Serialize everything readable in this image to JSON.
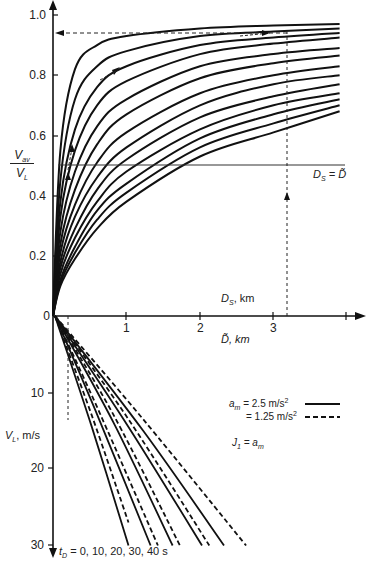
{
  "chart_data": [
    {
      "type": "line",
      "panel": "upper",
      "title": "",
      "ylabel": "V_av / V_L",
      "xlabel_top": "D_S, km",
      "xlabel_bottom": "D~, km",
      "ylim": [
        0,
        1.0
      ],
      "xlim": [
        0,
        4.0
      ],
      "y_ticks": [
        "0",
        "0.2",
        "0.4",
        "0.6",
        "0.8",
        "1.0"
      ],
      "x_ticks": [
        "1",
        "2",
        "3"
      ],
      "annotations": [
        "D_S = D~"
      ],
      "reference_lines": {
        "horizontal_y": 0.5,
        "dashed_vertical_x": [
          0.2,
          3.2
        ],
        "dashed_horizontal_y": 0.94
      },
      "grid": false,
      "series_description": "Family of 13 saturating curves of V_av/V_L vs distance, one per V_L value (steeper curves for lower V_L)",
      "series": [
        {
          "name": "curve-1",
          "x": [
            0,
            0.1,
            0.3,
            0.6,
            1.0,
            2.0,
            3.0,
            3.9
          ],
          "values": [
            0,
            0.55,
            0.82,
            0.9,
            0.93,
            0.955,
            0.965,
            0.97
          ]
        },
        {
          "name": "curve-2",
          "x": [
            0,
            0.1,
            0.3,
            0.6,
            1.0,
            2.0,
            3.0,
            3.9
          ],
          "values": [
            0,
            0.45,
            0.72,
            0.83,
            0.88,
            0.93,
            0.945,
            0.955
          ]
        },
        {
          "name": "curve-3",
          "x": [
            0,
            0.1,
            0.3,
            0.6,
            1.0,
            2.0,
            3.0,
            3.9
          ],
          "values": [
            0,
            0.38,
            0.62,
            0.76,
            0.83,
            0.9,
            0.925,
            0.94
          ]
        },
        {
          "name": "curve-4",
          "x": [
            0,
            0.1,
            0.3,
            0.6,
            1.0,
            2.0,
            3.0,
            3.9
          ],
          "values": [
            0,
            0.33,
            0.55,
            0.7,
            0.78,
            0.87,
            0.905,
            0.925
          ]
        },
        {
          "name": "curve-5",
          "x": [
            0,
            0.1,
            0.3,
            0.6,
            1.0,
            2.0,
            3.0,
            3.9
          ],
          "values": [
            0,
            0.28,
            0.48,
            0.63,
            0.72,
            0.83,
            0.87,
            0.89
          ]
        },
        {
          "name": "curve-6",
          "x": [
            0,
            0.1,
            0.3,
            0.6,
            1.0,
            2.0,
            3.0,
            3.9
          ],
          "values": [
            0,
            0.24,
            0.42,
            0.57,
            0.67,
            0.79,
            0.84,
            0.865
          ]
        },
        {
          "name": "curve-7",
          "x": [
            0,
            0.1,
            0.3,
            0.6,
            1.0,
            2.0,
            3.0,
            3.9
          ],
          "values": [
            0,
            0.21,
            0.37,
            0.51,
            0.61,
            0.74,
            0.8,
            0.83
          ]
        },
        {
          "name": "curve-8",
          "x": [
            0,
            0.1,
            0.3,
            0.6,
            1.0,
            2.0,
            3.0,
            3.9
          ],
          "values": [
            0,
            0.18,
            0.33,
            0.46,
            0.56,
            0.7,
            0.77,
            0.8
          ]
        },
        {
          "name": "curve-9",
          "x": [
            0,
            0.1,
            0.3,
            0.6,
            1.0,
            2.0,
            3.0,
            3.9
          ],
          "values": [
            0,
            0.16,
            0.29,
            0.42,
            0.52,
            0.66,
            0.73,
            0.77
          ]
        },
        {
          "name": "curve-10",
          "x": [
            0,
            0.1,
            0.3,
            0.6,
            1.0,
            2.0,
            3.0,
            3.9
          ],
          "values": [
            0,
            0.14,
            0.26,
            0.38,
            0.48,
            0.62,
            0.7,
            0.74
          ]
        },
        {
          "name": "curve-11",
          "x": [
            0,
            0.1,
            0.3,
            0.6,
            1.0,
            2.0,
            3.0,
            3.9
          ],
          "values": [
            0,
            0.12,
            0.23,
            0.35,
            0.44,
            0.59,
            0.67,
            0.72
          ]
        },
        {
          "name": "curve-12",
          "x": [
            0,
            0.1,
            0.3,
            0.6,
            1.0,
            2.0,
            3.0,
            3.9
          ],
          "values": [
            0,
            0.11,
            0.21,
            0.32,
            0.41,
            0.56,
            0.64,
            0.7
          ]
        },
        {
          "name": "curve-13",
          "x": [
            0,
            0.1,
            0.3,
            0.6,
            1.0,
            2.0,
            3.0,
            3.9
          ],
          "values": [
            0,
            0.1,
            0.19,
            0.29,
            0.38,
            0.53,
            0.61,
            0.68
          ]
        }
      ]
    },
    {
      "type": "line",
      "panel": "lower",
      "ylabel": "V_L, m/s",
      "ylim": [
        0,
        30
      ],
      "y_axis_inverted": true,
      "y_ticks": [
        "10",
        "20",
        "30"
      ],
      "xlabel": "D~, km",
      "legend": [
        {
          "label": "a_m = 2.5 m/s²",
          "style": "solid"
        },
        {
          "label": "= 1.25 m/s²",
          "style": "dashed"
        }
      ],
      "annotations": [
        "J_1 = a_m",
        "t_D = 0,  10,  20,  30,  40 s"
      ],
      "series": [
        {
          "name": "t_D=0 (2.5)",
          "style": "solid",
          "x": [
            0,
            0.5,
            1.0
          ],
          "values": [
            0,
            14.5,
            30
          ]
        },
        {
          "name": "t_D=0 (1.25)",
          "style": "dashed",
          "x": [
            0,
            0.5,
            1.0
          ],
          "values": [
            0,
            13.0,
            27
          ]
        },
        {
          "name": "t_D=10 (2.5)",
          "style": "solid",
          "x": [
            0,
            0.6,
            1.3
          ],
          "values": [
            0,
            13.5,
            30
          ]
        },
        {
          "name": "t_D=10 (1.25)",
          "style": "dashed",
          "x": [
            0,
            0.6,
            1.4
          ],
          "values": [
            0,
            12.5,
            30
          ]
        },
        {
          "name": "t_D=20 (2.5)",
          "style": "solid",
          "x": [
            0,
            0.8,
            1.6
          ],
          "values": [
            0,
            14.0,
            30
          ]
        },
        {
          "name": "t_D=20 (1.25)",
          "style": "dashed",
          "x": [
            0,
            0.8,
            1.7
          ],
          "values": [
            0,
            13.0,
            30
          ]
        },
        {
          "name": "t_D=30 (2.5)",
          "style": "solid",
          "x": [
            0,
            1.0,
            2.0
          ],
          "values": [
            0,
            14.5,
            30
          ]
        },
        {
          "name": "t_D=30 (1.25)",
          "style": "dashed",
          "x": [
            0,
            1.0,
            2.1
          ],
          "values": [
            0,
            13.5,
            30
          ]
        },
        {
          "name": "t_D=40 (2.5)",
          "style": "solid",
          "x": [
            0,
            1.2,
            2.3
          ],
          "values": [
            0,
            15.0,
            30
          ]
        },
        {
          "name": "t_D=40 (1.25)",
          "style": "dashed",
          "x": [
            0,
            1.2,
            2.6
          ],
          "values": [
            0,
            13.5,
            30
          ]
        }
      ]
    }
  ],
  "labels": {
    "y_upper_num": "V",
    "y_upper_num_sub": "av",
    "y_upper_den": "V",
    "y_upper_den_sub": "L",
    "ticks_upper": [
      "1.0",
      "0.8",
      "0.6",
      "0.4",
      "0.2",
      "0"
    ],
    "ticks_lower": [
      "10",
      "20",
      "30"
    ],
    "ticks_x": [
      "1",
      "2",
      "3"
    ],
    "ds_eq_d_main": "D",
    "ds_eq_d_sub": "S",
    "ds_eq_d_rest": " = D̃",
    "ds_km_main": "D",
    "ds_km_sub": "S",
    "ds_km_rest": ", km",
    "dtilde_km": "D̃, km",
    "vl_main": "V",
    "vl_sub": "L",
    "vl_rest": ", m/s",
    "legend_am": "a",
    "legend_am_sub": "m",
    "legend_solid_value": " = 2.5 m/s",
    "legend_dashed_value": "= 1.25 m/s",
    "legend_sup": "2",
    "j1_main": "J",
    "j1_sub": "1",
    "j1_eq": " = a",
    "j1_eq_sub": "m",
    "td_main": "t",
    "td_sub": "D",
    "td_values": " = 0,    10,   20,   30,   40 s"
  },
  "colors": {
    "ink": "#111111",
    "text": "#222222",
    "background": "#ffffff"
  }
}
